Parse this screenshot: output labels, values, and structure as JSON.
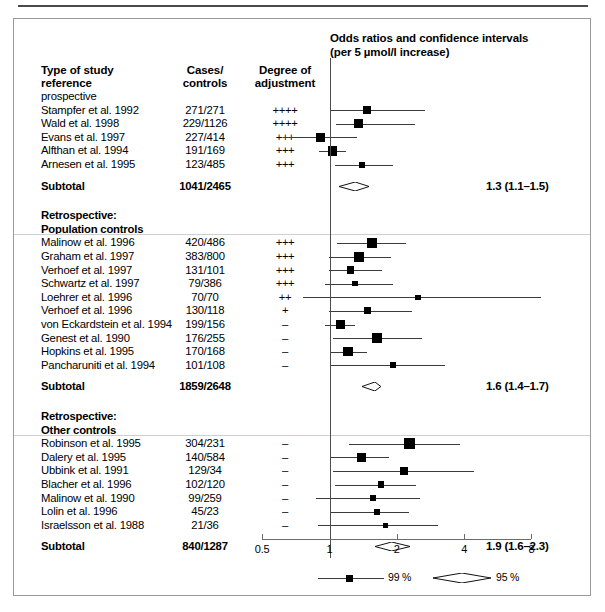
{
  "figure": {
    "plot_title_line1": "Odds ratios and confidence intervals",
    "plot_title_line2": "(per 5 µmol/l increase)",
    "columns": {
      "study_line1": "Type of study",
      "study_line2": "reference",
      "cases_line1": "Cases/",
      "cases_line2": "controls",
      "adjust_line1": "Degree of",
      "adjust_line2": "adjustment"
    }
  },
  "sections": [
    {
      "heading": [
        "prospective"
      ],
      "heading_bold": [
        false
      ],
      "rows": [
        {
          "study": "Stampfer et al. 1992",
          "counts": "271/271",
          "adjust": "++++",
          "or": 1.47,
          "lo": 1.0,
          "hi": 2.68,
          "size": 8.5
        },
        {
          "study": "Wald et al. 1998",
          "counts": "229/1126",
          "adjust": "++++",
          "or": 1.35,
          "lo": 1.07,
          "hi": 2.42,
          "size": 8.5
        },
        {
          "study": "Evans et al. 1997",
          "counts": "227/414",
          "adjust": "+++",
          "or": 0.91,
          "lo": 0.62,
          "hi": 1.33,
          "size": 9.0
        },
        {
          "study": "Alfthan et al. 1994",
          "counts": "191/169",
          "adjust": "+++",
          "or": 1.03,
          "lo": 0.9,
          "hi": 1.18,
          "size": 9.5
        },
        {
          "study": "Arnesen et al. 1995",
          "counts": "123/485",
          "adjust": "+++",
          "or": 1.4,
          "lo": 1.06,
          "hi": 1.93,
          "size": 6.0
        }
      ],
      "subtotal_label": "Subtotal",
      "subtotal_counts": "1041/2465",
      "subtotal_text": "1.3 (1.1–1.5)",
      "subtotal_or": 1.3,
      "subtotal_lo": 1.1,
      "subtotal_hi": 1.5
    },
    {
      "heading": [
        "Retrospective:",
        "Population controls"
      ],
      "heading_bold": [
        true,
        true
      ],
      "rows": [
        {
          "study": "Malinow et al. 1996",
          "counts": "420/486",
          "adjust": "+++",
          "or": 1.55,
          "lo": 1.08,
          "hi": 2.19,
          "size": 10.5
        },
        {
          "study": "Graham et al. 1997",
          "counts": "383/800",
          "adjust": "+++",
          "or": 1.35,
          "lo": 0.99,
          "hi": 1.88,
          "size": 10.0
        },
        {
          "study": "Verhoef et al. 1997",
          "counts": "131/101",
          "adjust": "+++",
          "or": 1.24,
          "lo": 0.99,
          "hi": 1.72,
          "size": 7.5
        },
        {
          "study": "Schwartz et al. 1997",
          "counts": "79/386",
          "adjust": "+++",
          "or": 1.3,
          "lo": 0.95,
          "hi": 1.92,
          "size": 5.5
        },
        {
          "study": "Loehrer et al. 1996",
          "counts": "70/70",
          "adjust": "++",
          "or": 2.49,
          "lo": 0.76,
          "hi": 8.8,
          "size": 5.5
        },
        {
          "study": "Verhoef et al. 1996",
          "counts": "130/118",
          "adjust": "+",
          "or": 1.48,
          "lo": 0.99,
          "hi": 2.35,
          "size": 7.0
        },
        {
          "study": "von Eckardstein et al. 1994",
          "counts": "199/156",
          "adjust": "–",
          "or": 1.12,
          "lo": 0.95,
          "hi": 1.3,
          "size": 9.5
        },
        {
          "study": "Genest et al. 1990",
          "counts": "176/255",
          "adjust": "–",
          "or": 1.63,
          "lo": 1.04,
          "hi": 2.6,
          "size": 9.5
        },
        {
          "study": "Hopkins et al. 1995",
          "counts": "170/168",
          "adjust": "–",
          "or": 1.21,
          "lo": 1.01,
          "hi": 1.47,
          "size": 9.5
        },
        {
          "study": "Pancharuniti et al. 1994",
          "counts": "101/108",
          "adjust": "–",
          "or": 1.92,
          "lo": 1.01,
          "hi": 3.3,
          "size": 6.0
        }
      ],
      "subtotal_label": "Subtotal",
      "subtotal_counts": "1859/2648",
      "subtotal_text": "1.6 (1.4–1.7)",
      "subtotal_or": 1.6,
      "subtotal_lo": 1.4,
      "subtotal_hi": 1.7
    },
    {
      "heading": [
        "Retrospective:",
        "Other controls"
      ],
      "heading_bold": [
        true,
        true
      ],
      "rows": [
        {
          "study": "Robinson et al. 1995",
          "counts": "304/231",
          "adjust": "–",
          "or": 2.28,
          "lo": 1.22,
          "hi": 3.85,
          "size": 11.0
        },
        {
          "study": "Dalery et al. 1995",
          "counts": "140/584",
          "adjust": "–",
          "or": 1.39,
          "lo": 1.02,
          "hi": 1.85,
          "size": 8.5
        },
        {
          "study": "Ubbink et al. 1991",
          "counts": "129/34",
          "adjust": "–",
          "or": 2.15,
          "lo": 1.04,
          "hi": 4.45,
          "size": 8.0
        },
        {
          "study": "Blacher et al. 1996",
          "counts": "102/120",
          "adjust": "–",
          "or": 1.7,
          "lo": 1.06,
          "hi": 2.44,
          "size": 6.5
        },
        {
          "study": "Malinow et al. 1990",
          "counts": "99/259",
          "adjust": "–",
          "or": 1.57,
          "lo": 0.87,
          "hi": 2.55,
          "size": 6.0
        },
        {
          "study": "Lolin et al. 1996",
          "counts": "45/23",
          "adjust": "–",
          "or": 1.63,
          "lo": 1.02,
          "hi": 2.27,
          "size": 6.0
        },
        {
          "study": "Israelsson et al. 1988",
          "counts": "21/36",
          "adjust": "–",
          "or": 1.78,
          "lo": 0.89,
          "hi": 3.05,
          "size": 5.0
        }
      ],
      "subtotal_label": "Subtotal",
      "subtotal_counts": "840/1287",
      "subtotal_text": "1.9 (1.6–2.3)",
      "subtotal_or": 1.9,
      "subtotal_lo": 1.6,
      "subtotal_hi": 2.3
    }
  ],
  "axis": {
    "ticks": [
      {
        "value": 0.5,
        "label": "0.5"
      },
      {
        "value": 1,
        "label": "1"
      },
      {
        "value": 2,
        "label": "2"
      },
      {
        "value": 4,
        "label": "4"
      },
      {
        "value": 8,
        "label": "8"
      }
    ],
    "scale": "log2",
    "reference_value": 1
  },
  "legend": {
    "ci99_label": "99 %",
    "ci95_label": "95 %"
  },
  "chart_data": {
    "type": "scatter",
    "title": "Odds ratios and confidence intervals (per 5 µmol/l increase)",
    "xlabel": "Odds ratio (log scale)",
    "ylabel": "",
    "xlim": [
      0.45,
      9.5
    ],
    "xscale": "log2",
    "xticks": [
      0.5,
      1,
      2,
      4,
      8
    ],
    "grid": false,
    "reference_line": 1,
    "marker_ci": "99 %",
    "summary_ci": "95 %",
    "groups": [
      {
        "name": "prospective",
        "points": [
          {
            "label": "Stampfer et al. 1992",
            "cases_controls": "271/271",
            "adjustment": "++++",
            "or": 1.47,
            "ci_low": 1.0,
            "ci_high": 2.68
          },
          {
            "label": "Wald et al. 1998",
            "cases_controls": "229/1126",
            "adjustment": "++++",
            "or": 1.35,
            "ci_low": 1.07,
            "ci_high": 2.42
          },
          {
            "label": "Evans et al. 1997",
            "cases_controls": "227/414",
            "adjustment": "+++",
            "or": 0.91,
            "ci_low": 0.62,
            "ci_high": 1.33
          },
          {
            "label": "Alfthan et al. 1994",
            "cases_controls": "191/169",
            "adjustment": "+++",
            "or": 1.03,
            "ci_low": 0.9,
            "ci_high": 1.18
          },
          {
            "label": "Arnesen et al. 1995",
            "cases_controls": "123/485",
            "adjustment": "+++",
            "or": 1.4,
            "ci_low": 1.06,
            "ci_high": 1.93
          }
        ],
        "subtotal": {
          "cases_controls": "1041/2465",
          "or": 1.3,
          "ci_low": 1.1,
          "ci_high": 1.5,
          "text": "1.3 (1.1–1.5)"
        }
      },
      {
        "name": "Retrospective: Population controls",
        "points": [
          {
            "label": "Malinow et al. 1996",
            "cases_controls": "420/486",
            "adjustment": "+++",
            "or": 1.55,
            "ci_low": 1.08,
            "ci_high": 2.19
          },
          {
            "label": "Graham et al. 1997",
            "cases_controls": "383/800",
            "adjustment": "+++",
            "or": 1.35,
            "ci_low": 0.99,
            "ci_high": 1.88
          },
          {
            "label": "Verhoef et al. 1997",
            "cases_controls": "131/101",
            "adjustment": "+++",
            "or": 1.24,
            "ci_low": 0.99,
            "ci_high": 1.72
          },
          {
            "label": "Schwartz et al. 1997",
            "cases_controls": "79/386",
            "adjustment": "+++",
            "or": 1.3,
            "ci_low": 0.95,
            "ci_high": 1.92
          },
          {
            "label": "Loehrer et al. 1996",
            "cases_controls": "70/70",
            "adjustment": "++",
            "or": 2.49,
            "ci_low": 0.76,
            "ci_high": 8.8
          },
          {
            "label": "Verhoef et al. 1996",
            "cases_controls": "130/118",
            "adjustment": "+",
            "or": 1.48,
            "ci_low": 0.99,
            "ci_high": 2.35
          },
          {
            "label": "von Eckardstein et al. 1994",
            "cases_controls": "199/156",
            "adjustment": "–",
            "or": 1.12,
            "ci_low": 0.95,
            "ci_high": 1.3
          },
          {
            "label": "Genest et al. 1990",
            "cases_controls": "176/255",
            "adjustment": "–",
            "or": 1.63,
            "ci_low": 1.04,
            "ci_high": 2.6
          },
          {
            "label": "Hopkins et al. 1995",
            "cases_controls": "170/168",
            "adjustment": "–",
            "or": 1.21,
            "ci_low": 1.01,
            "ci_high": 1.47
          },
          {
            "label": "Pancharuniti et al. 1994",
            "cases_controls": "101/108",
            "adjustment": "–",
            "or": 1.92,
            "ci_low": 1.01,
            "ci_high": 3.3
          }
        ],
        "subtotal": {
          "cases_controls": "1859/2648",
          "or": 1.6,
          "ci_low": 1.4,
          "ci_high": 1.7,
          "text": "1.6 (1.4–1.7)"
        }
      },
      {
        "name": "Retrospective: Other controls",
        "points": [
          {
            "label": "Robinson et al. 1995",
            "cases_controls": "304/231",
            "adjustment": "–",
            "or": 2.28,
            "ci_low": 1.22,
            "ci_high": 3.85
          },
          {
            "label": "Dalery et al. 1995",
            "cases_controls": "140/584",
            "adjustment": "–",
            "or": 1.39,
            "ci_low": 1.02,
            "ci_high": 1.85
          },
          {
            "label": "Ubbink et al. 1991",
            "cases_controls": "129/34",
            "adjustment": "–",
            "or": 2.15,
            "ci_low": 1.04,
            "ci_high": 4.45
          },
          {
            "label": "Blacher et al. 1996",
            "cases_controls": "102/120",
            "adjustment": "–",
            "or": 1.7,
            "ci_low": 1.06,
            "ci_high": 2.44
          },
          {
            "label": "Malinow et al. 1990",
            "cases_controls": "99/259",
            "adjustment": "–",
            "or": 1.57,
            "ci_low": 0.87,
            "ci_high": 2.55
          },
          {
            "label": "Lolin et al. 1996",
            "cases_controls": "45/23",
            "adjustment": "–",
            "or": 1.63,
            "ci_low": 1.02,
            "ci_high": 2.27
          },
          {
            "label": "Israelsson et al. 1988",
            "cases_controls": "21/36",
            "adjustment": "–",
            "or": 1.78,
            "ci_low": 0.89,
            "ci_high": 3.05
          }
        ],
        "subtotal": {
          "cases_controls": "840/1287",
          "or": 1.9,
          "ci_low": 1.6,
          "ci_high": 2.3,
          "text": "1.9 (1.6–2.3)"
        }
      }
    ]
  }
}
